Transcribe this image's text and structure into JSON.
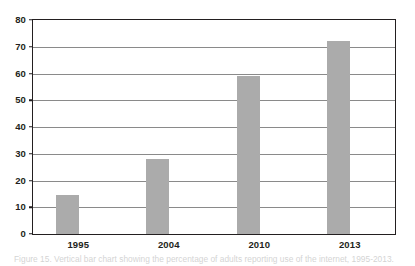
{
  "chart_data": {
    "type": "bar",
    "title": "",
    "subtitle": "",
    "xlabel": "",
    "ylabel": "",
    "categories": [
      "1995",
      "2004",
      "2010",
      "2013"
    ],
    "values": [
      14.5,
      28,
      59,
      72
    ],
    "series": [
      {
        "name": "",
        "values": [
          14.5,
          28,
          59,
          72
        ]
      }
    ],
    "ylim": [
      0,
      80
    ],
    "yticks": [
      0,
      10,
      20,
      30,
      40,
      50,
      60,
      70,
      80
    ],
    "ytick_labels": [
      "0",
      "10",
      "20",
      "30",
      "40",
      "50",
      "60",
      "70",
      "80"
    ],
    "grid": true,
    "grid_axis": "y",
    "legend": false,
    "legend_position": "none",
    "annotations": [],
    "colors": {
      "bar_fill": "#ababab",
      "gridline": "#8a8a8a",
      "axis_frame": "#231f20",
      "tick_label": "#231f20",
      "background": "#ffffff"
    }
  },
  "caption": {
    "text": "Figure 15. Vertical bar chart showing the percentage of adults reporting use of the internet, 1995-2013.",
    "clipped": true
  }
}
